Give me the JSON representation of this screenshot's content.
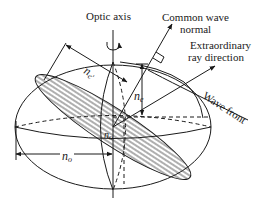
{
  "figure": {
    "labels": {
      "optic_axis": "Optic axis",
      "common_wave_normal_line1": "Common wave",
      "common_wave_normal_line2": "normal",
      "extraordinary_line1": "Extraordinary",
      "extraordinary_line2": "ray direction",
      "wave_front": "Wave front",
      "n_e_prime_base": "n",
      "n_e_prime_sub": "e'",
      "n_e_base": "n",
      "n_e_sub": "e",
      "n_o_center_base": "n",
      "n_o_center_sub": "o",
      "n_o_bottom_base": "n",
      "n_o_bottom_sub": "o"
    },
    "colors": {
      "ink": "#1a1a1a",
      "background": "#ffffff"
    }
  }
}
